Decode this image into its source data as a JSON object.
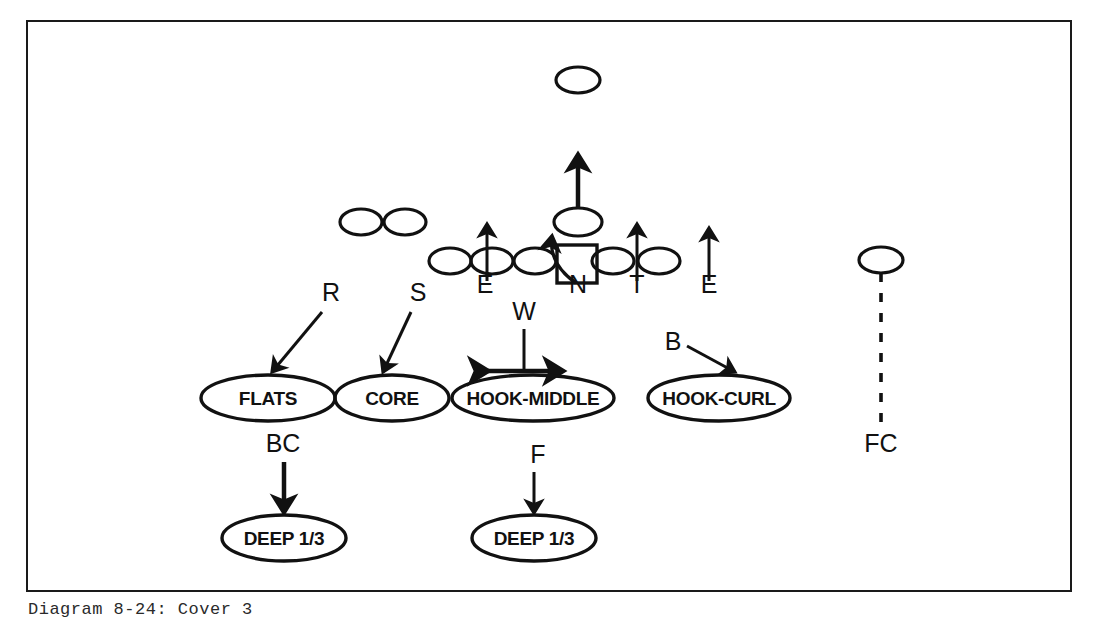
{
  "caption": {
    "text": "Diagram 8-24: Cover 3"
  },
  "diagram": {
    "frame": {
      "stroke_color": "#1a1a1a",
      "background_color": "#ffffff"
    },
    "defensive_positions": [
      {
        "label": "E",
        "x": 485,
        "y": 293
      },
      {
        "label": "N",
        "x": 578,
        "y": 293
      },
      {
        "label": "T",
        "x": 637,
        "y": 293
      },
      {
        "label": "E",
        "x": 709,
        "y": 293
      }
    ],
    "linebacker_labels": [
      {
        "label": "R",
        "x": 331,
        "y": 301
      },
      {
        "label": "S",
        "x": 418,
        "y": 301
      },
      {
        "label": "W",
        "x": 524,
        "y": 320
      },
      {
        "label": "B",
        "x": 673,
        "y": 350
      }
    ],
    "secondary_labels": [
      {
        "label": "BC",
        "x": 283,
        "y": 452
      },
      {
        "label": "F",
        "x": 538,
        "y": 463
      },
      {
        "label": "FC",
        "x": 881,
        "y": 452
      }
    ],
    "zones": [
      {
        "label": "FLATS",
        "cx": 268,
        "cy": 398,
        "rx": 67,
        "ry": 23
      },
      {
        "label": "CORE",
        "cx": 392,
        "cy": 398,
        "rx": 57,
        "ry": 23
      },
      {
        "label": "HOOK-MIDDLE",
        "cx": 533,
        "cy": 398,
        "rx": 81,
        "ry": 23
      },
      {
        "label": "HOOK-CURL",
        "cx": 719,
        "cy": 398,
        "rx": 71,
        "ry": 23
      },
      {
        "label": "DEEP 1/3",
        "cx": 284,
        "cy": 538,
        "rx": 62,
        "ry": 23
      },
      {
        "label": "DEEP 1/3",
        "cx": 534,
        "cy": 538,
        "rx": 62,
        "ry": 23
      }
    ],
    "offense": [
      {
        "name": "receiver-split-left-outer",
        "cx": 361,
        "cy": 222,
        "rx": 21,
        "ry": 13
      },
      {
        "name": "receiver-split-left-inner",
        "cx": 405,
        "cy": 222,
        "rx": 21,
        "ry": 13
      },
      {
        "name": "lineman-1",
        "cx": 450,
        "cy": 261,
        "rx": 21,
        "ry": 13
      },
      {
        "name": "lineman-2",
        "cx": 492,
        "cy": 261,
        "rx": 21,
        "ry": 13
      },
      {
        "name": "lineman-3",
        "cx": 535,
        "cy": 261,
        "rx": 21,
        "ry": 13
      },
      {
        "name": "lineman-4",
        "cx": 613,
        "cy": 261,
        "rx": 21,
        "ry": 13
      },
      {
        "name": "lineman-5",
        "cx": 659,
        "cy": 261,
        "rx": 21,
        "ry": 13
      },
      {
        "name": "quarterback",
        "cx": 578,
        "cy": 222,
        "rx": 24,
        "ry": 14
      },
      {
        "name": "deep-back",
        "cx": 578,
        "cy": 80,
        "rx": 22,
        "ry": 13
      },
      {
        "name": "receiver-split-right",
        "cx": 881,
        "cy": 260,
        "rx": 22,
        "ry": 13
      },
      {
        "name": "center",
        "x": 557,
        "y": 245,
        "w": 40,
        "h": 38
      }
    ]
  }
}
